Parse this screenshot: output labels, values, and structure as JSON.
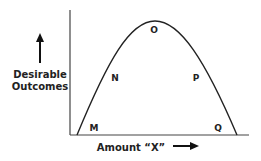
{
  "diagram": {
    "type": "inverted-u-curve",
    "y_axis_label_line1": "Desirable",
    "y_axis_label_line2": "Outcomes",
    "x_axis_label": "Amount “X”",
    "points": [
      {
        "label": "M",
        "x": 94,
        "y": 129
      },
      {
        "label": "N",
        "x": 115,
        "y": 80
      },
      {
        "label": "O",
        "x": 154,
        "y": 32
      },
      {
        "label": "P",
        "x": 196,
        "y": 80
      },
      {
        "label": "Q",
        "x": 218,
        "y": 130
      }
    ],
    "colors": {
      "line": "#222222",
      "axis": "#444444",
      "text": "#222222",
      "background": "#ffffff"
    }
  }
}
